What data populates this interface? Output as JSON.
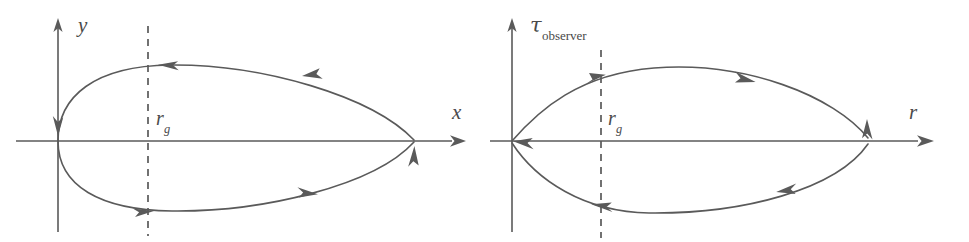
{
  "figure": {
    "type": "diagram",
    "background_color": "#ffffff",
    "ink_color": "#5a5a5a",
    "panels": [
      {
        "id": "left-panel",
        "name": "coordinate-frame-panel",
        "axes": {
          "vertical": {
            "label": "y",
            "label_type": "italic",
            "arrow": "up"
          },
          "horizontal": {
            "label": "x",
            "label_type": "italic",
            "arrow": "right"
          }
        },
        "marker": {
          "label_base": "r",
          "label_sub": "g",
          "style": "dashed-vertical-line",
          "name": "gravitational-radius-line"
        },
        "curve": {
          "name": "trajectory-curve",
          "shape": "teardrop",
          "orientation": "counter-clockwise",
          "start_point": "origin",
          "end_point": "origin",
          "arrow_directions": [
            "left",
            "left",
            "up",
            "right"
          ]
        }
      },
      {
        "id": "right-panel",
        "name": "observer-time-panel",
        "axes": {
          "vertical": {
            "label_base": "τ",
            "label_sub": "observer",
            "label_type": "tau-subscript",
            "arrow": "up"
          },
          "horizontal": {
            "label": "r",
            "label_type": "italic",
            "arrow": "right"
          }
        },
        "marker": {
          "label_base": "r",
          "label_sub": "g",
          "style": "dashed-vertical-line",
          "name": "gravitational-radius-line"
        },
        "curve": {
          "name": "trajectory-curve",
          "shape": "teardrop",
          "orientation": "clockwise",
          "start_point": "origin",
          "end_point": "origin",
          "arrow_directions": [
            "right",
            "right",
            "down",
            "left",
            "left"
          ]
        }
      }
    ]
  }
}
